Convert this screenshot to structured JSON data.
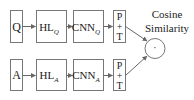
{
  "diagram": {
    "title_line1": "Cosine",
    "title_line2": "Similarity",
    "rows": [
      {
        "input": "Q",
        "hl": {
          "base": "HL",
          "sub": "Q"
        },
        "cnn": {
          "base": "CNN",
          "sub": "Q"
        },
        "pool": {
          "line1": "P",
          "line2": "+",
          "line3": "T"
        }
      },
      {
        "input": "A",
        "hl": {
          "base": "HL",
          "sub": "A"
        },
        "cnn": {
          "base": "CNN",
          "sub": "A"
        },
        "pool": {
          "line1": "P",
          "line2": "+",
          "line3": "T"
        }
      }
    ],
    "combine_symbol": "·",
    "colors": {
      "stroke": "#777777",
      "text": "#222222",
      "background": "#ffffff"
    }
  }
}
